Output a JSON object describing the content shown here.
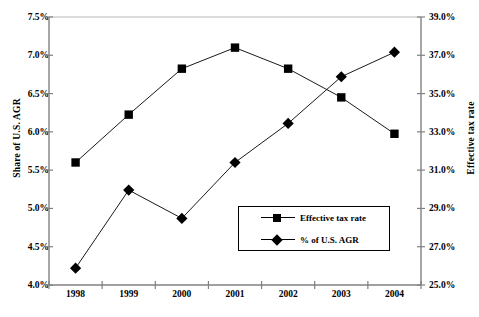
{
  "chart_data": {
    "type": "line",
    "title": "",
    "xlabel": "",
    "categories": [
      "1998",
      "1999",
      "2000",
      "2001",
      "2002",
      "2003",
      "2004"
    ],
    "grid": false,
    "legend_position": "inside-lower-right",
    "axes": {
      "left": {
        "label": "Share of U.S. AGR",
        "ticks": [
          "4.0%",
          "4.5%",
          "5.0%",
          "5.5%",
          "6.0%",
          "6.5%",
          "7.0%",
          "7.5%"
        ],
        "tick_values": [
          4.0,
          4.5,
          5.0,
          5.5,
          6.0,
          6.5,
          7.0,
          7.5
        ],
        "ylim": [
          4.0,
          7.5
        ]
      },
      "right": {
        "label": "Effective tax rate",
        "ticks": [
          "25.0%",
          "27.0%",
          "29.0%",
          "31.0%",
          "33.0%",
          "35.0%",
          "37.0%",
          "39.0%"
        ],
        "tick_values": [
          25.0,
          27.0,
          29.0,
          31.0,
          33.0,
          35.0,
          37.0,
          39.0
        ],
        "ylim": [
          25.0,
          39.0
        ]
      }
    },
    "series": [
      {
        "name": "Effective tax rate",
        "marker": "square",
        "axis": "right",
        "values": [
          31.4,
          33.9,
          36.3,
          37.4,
          36.3,
          34.8,
          32.9
        ]
      },
      {
        "name": "% of U.S. AGR",
        "marker": "diamond",
        "axis": "left",
        "values": [
          4.22,
          5.24,
          4.87,
          5.6,
          6.11,
          6.72,
          7.04
        ]
      }
    ]
  },
  "legend": {
    "items": [
      {
        "label": "Effective tax rate",
        "marker": "square"
      },
      {
        "label": "% of U.S. AGR",
        "marker": "diamond"
      }
    ]
  },
  "colors": {
    "series": "#000000",
    "axis": "#808080",
    "background": "#ffffff"
  }
}
